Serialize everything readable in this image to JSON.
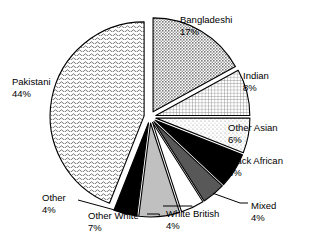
{
  "chart_data": {
    "type": "pie",
    "title": "",
    "subtitle": "",
    "xlabel": "",
    "ylabel": "",
    "legend_position": "none",
    "grid": false,
    "unit": "%",
    "categories": [
      "Bangladeshi",
      "Indian",
      "Other Asian",
      "Black African",
      "Mixed",
      "White British",
      "Other White",
      "Other",
      "Pakistani"
    ],
    "values": [
      17,
      8,
      6,
      6,
      4,
      4,
      7,
      4,
      44
    ],
    "slices": [
      {
        "label": "Bangladeshi",
        "pct": 17,
        "pct_text": "17%",
        "fill": "checker-mid",
        "color": "#b5b5b5",
        "start_deg": 0,
        "end_deg": 61.2,
        "explode": 6,
        "label_x": 180,
        "label_y": 14,
        "label_align": "left",
        "leader": false
      },
      {
        "label": "Indian",
        "pct": 8,
        "pct_text": "8%",
        "fill": "grid-fine",
        "color": "#c9c9c9",
        "start_deg": 61.2,
        "end_deg": 90.0,
        "explode": 6,
        "label_x": 243,
        "label_y": 70,
        "label_align": "left",
        "leader": false
      },
      {
        "label": "Other Asian",
        "pct": 6,
        "pct_text": "6%",
        "fill": "dots-light",
        "color": "#dcdcdc",
        "start_deg": 90.0,
        "end_deg": 111.6,
        "explode": 6,
        "label_x": 228,
        "label_y": 122,
        "label_align": "left",
        "leader": false
      },
      {
        "label": "Black African",
        "pct": 6,
        "pct_text": "6%",
        "fill": "solid-black",
        "color": "#000000",
        "start_deg": 111.6,
        "end_deg": 133.2,
        "explode": 6,
        "label_x": 228,
        "label_y": 155,
        "label_align": "left",
        "leader": false
      },
      {
        "label": "Mixed",
        "pct": 4,
        "pct_text": "4%",
        "fill": "solid-darkgray",
        "color": "#585858",
        "start_deg": 133.2,
        "end_deg": 147.6,
        "explode": 6,
        "label_x": 251,
        "label_y": 200,
        "label_align": "left",
        "leader": true
      },
      {
        "label": "White British",
        "pct": 4,
        "pct_text": "4%",
        "fill": "solid-white",
        "color": "#ffffff",
        "start_deg": 147.6,
        "end_deg": 162.0,
        "explode": 6,
        "label_x": 166,
        "label_y": 208,
        "label_align": "left",
        "leader": true
      },
      {
        "label": "Other White",
        "pct": 7,
        "pct_text": "7%",
        "fill": "solid-lightgray",
        "color": "#c0c0c0",
        "start_deg": 162.0,
        "end_deg": 187.2,
        "explode": 6,
        "label_x": 88,
        "label_y": 210,
        "label_align": "left",
        "leader": true
      },
      {
        "label": "Other",
        "pct": 4,
        "pct_text": "4%",
        "fill": "solid-black",
        "color": "#000000",
        "start_deg": 187.2,
        "end_deg": 201.6,
        "explode": 6,
        "label_x": 42,
        "label_y": 192,
        "label_align": "left",
        "leader": true
      },
      {
        "label": "Pakistani",
        "pct": 44,
        "pct_text": "44%",
        "fill": "wave-light",
        "color": "#ededed",
        "start_deg": 201.6,
        "end_deg": 360.0,
        "explode": 6,
        "label_x": 12,
        "label_y": 76,
        "label_align": "left",
        "leader": false
      }
    ],
    "geometry": {
      "center_x": 150,
      "center_y": 117,
      "radius": 94,
      "start_angle_deg": 0,
      "direction": "clockwise"
    }
  }
}
